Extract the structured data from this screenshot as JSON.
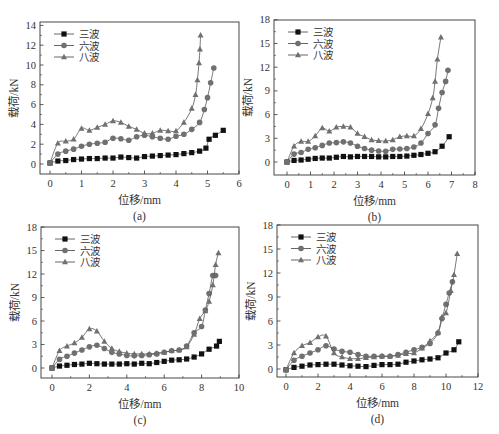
{
  "figure": {
    "legend_labels": [
      "三波",
      "六波",
      "八波"
    ],
    "colors": {
      "frame": "#333333",
      "series_0": "#111111",
      "series_1": "#707070",
      "series_2": "#707070",
      "line": "#555555"
    }
  },
  "chart_data": [
    {
      "type": "line",
      "panel_label": "(a)",
      "xlabel": "位移/mm",
      "ylabel": "载荷/kN",
      "xlim": [
        -0.3,
        6
      ],
      "ylim": [
        -0.9,
        14
      ],
      "xticks": [
        0,
        1,
        2,
        3,
        4,
        5,
        6
      ],
      "yticks": [
        0,
        2,
        4,
        6,
        8,
        10,
        12,
        14
      ],
      "legend_position": "upper-left",
      "grid": false,
      "frame": {
        "left": 40,
        "top": 22,
        "right": 239,
        "bottom": 174,
        "x0px": 50,
        "xscale": 31.5,
        "y0px": 164,
        "yscale": 9.9
      },
      "series": [
        {
          "name": "三波",
          "marker": "square",
          "x": [
            0,
            0.25,
            0.5,
            0.75,
            1.0,
            1.25,
            1.5,
            1.75,
            2.0,
            2.25,
            2.5,
            2.75,
            3.0,
            3.25,
            3.5,
            3.75,
            4.0,
            4.25,
            4.5,
            4.75,
            4.95,
            5.05,
            5.25,
            5.5
          ],
          "y": [
            0.1,
            0.3,
            0.35,
            0.45,
            0.5,
            0.55,
            0.55,
            0.6,
            0.6,
            0.7,
            0.65,
            0.6,
            0.75,
            0.8,
            0.85,
            0.9,
            0.95,
            1.05,
            1.15,
            1.3,
            1.6,
            2.5,
            2.9,
            3.4
          ]
        },
        {
          "name": "六波",
          "marker": "circle",
          "x": [
            0,
            0.25,
            0.5,
            0.75,
            1.0,
            1.25,
            1.5,
            1.75,
            2.0,
            2.25,
            2.5,
            2.75,
            3.0,
            3.25,
            3.5,
            3.75,
            4.0,
            4.25,
            4.5,
            4.75,
            4.9,
            5.0,
            5.1,
            5.2
          ],
          "y": [
            0.1,
            1.0,
            1.3,
            1.5,
            1.8,
            2.0,
            2.1,
            2.2,
            2.6,
            2.55,
            2.4,
            2.75,
            2.9,
            2.75,
            2.6,
            2.5,
            2.8,
            3.0,
            3.5,
            4.2,
            5.5,
            6.7,
            8.2,
            9.7
          ]
        },
        {
          "name": "八波",
          "marker": "triangle",
          "x": [
            0,
            0.25,
            0.5,
            0.75,
            1.0,
            1.25,
            1.5,
            1.75,
            2.0,
            2.25,
            2.5,
            2.75,
            3.0,
            3.25,
            3.5,
            3.75,
            4.0,
            4.25,
            4.5,
            4.62,
            4.68,
            4.73,
            4.76,
            4.78
          ],
          "y": [
            0.1,
            2.1,
            2.3,
            2.5,
            3.6,
            3.4,
            3.7,
            4.0,
            4.35,
            4.2,
            3.8,
            3.5,
            3.1,
            3.1,
            3.4,
            3.35,
            3.35,
            4.2,
            5.6,
            7.0,
            8.5,
            10.2,
            11.6,
            13.0
          ]
        }
      ]
    },
    {
      "type": "line",
      "panel_label": "(b)",
      "xlabel": "位移/mm",
      "ylabel": "载荷/kN",
      "xlim": [
        -0.5,
        8
      ],
      "ylim": [
        -1.5,
        18
      ],
      "xticks": [
        0,
        1,
        2,
        3,
        4,
        5,
        6,
        7,
        8
      ],
      "yticks": [
        0,
        3,
        6,
        9,
        12,
        15,
        18
      ],
      "legend_position": "upper-left",
      "grid": false,
      "frame": {
        "left": 274,
        "top": 20,
        "right": 475,
        "bottom": 175,
        "x0px": 287,
        "xscale": 23.5,
        "y0px": 162,
        "yscale": 7.9
      },
      "series": [
        {
          "name": "三波",
          "marker": "square",
          "x": [
            0,
            0.3,
            0.6,
            0.9,
            1.2,
            1.5,
            1.8,
            2.1,
            2.4,
            2.7,
            3.0,
            3.3,
            3.6,
            3.9,
            4.2,
            4.5,
            4.8,
            5.1,
            5.4,
            5.7,
            6.0,
            6.3,
            6.6,
            6.9
          ],
          "y": [
            0,
            0.2,
            0.25,
            0.35,
            0.45,
            0.5,
            0.5,
            0.6,
            0.7,
            0.65,
            0.7,
            0.7,
            0.7,
            0.65,
            0.65,
            0.7,
            0.7,
            0.75,
            0.85,
            0.95,
            1.1,
            1.3,
            2.0,
            3.2
          ]
        },
        {
          "name": "六波",
          "marker": "circle",
          "x": [
            0,
            0.3,
            0.6,
            0.9,
            1.2,
            1.5,
            1.8,
            2.1,
            2.4,
            2.7,
            3.0,
            3.3,
            3.6,
            3.9,
            4.2,
            4.5,
            4.8,
            5.1,
            5.4,
            5.7,
            6.0,
            6.3,
            6.45,
            6.6,
            6.75,
            6.85
          ],
          "y": [
            0,
            1.0,
            1.2,
            1.6,
            1.8,
            2.1,
            2.4,
            2.45,
            2.55,
            2.4,
            2.0,
            1.7,
            1.5,
            1.4,
            1.35,
            1.6,
            1.65,
            1.7,
            1.9,
            2.4,
            3.6,
            4.7,
            6.8,
            8.8,
            10.2,
            11.6
          ]
        },
        {
          "name": "八波",
          "marker": "triangle",
          "x": [
            0,
            0.3,
            0.6,
            0.9,
            1.2,
            1.5,
            1.8,
            2.1,
            2.4,
            2.7,
            3.0,
            3.3,
            3.6,
            3.9,
            4.2,
            4.5,
            4.8,
            5.1,
            5.4,
            5.7,
            6.0,
            6.2,
            6.3,
            6.4,
            6.55
          ],
          "y": [
            0,
            2.0,
            2.6,
            2.6,
            3.3,
            4.3,
            3.9,
            4.4,
            4.5,
            4.4,
            3.6,
            3.2,
            2.8,
            2.7,
            2.65,
            2.8,
            3.2,
            3.3,
            3.3,
            4.2,
            6.1,
            8.1,
            10.2,
            13.0,
            15.8
          ]
        }
      ]
    },
    {
      "type": "line",
      "panel_label": "(c)",
      "xlabel": "位移/mm",
      "ylabel": "载荷/kN",
      "xlim": [
        -0.6,
        10
      ],
      "ylim": [
        -1.5,
        18
      ],
      "xticks": [
        0,
        2,
        4,
        6,
        8,
        10
      ],
      "yticks": [
        0,
        3,
        6,
        9,
        12,
        15,
        18
      ],
      "legend_position": "upper-left",
      "grid": false,
      "frame": {
        "left": 41,
        "top": 227,
        "right": 239,
        "bottom": 378,
        "x0px": 52,
        "xscale": 18.7,
        "y0px": 368,
        "yscale": 7.83
      },
      "series": [
        {
          "name": "三波",
          "marker": "square",
          "x": [
            0,
            0.4,
            0.8,
            1.2,
            1.6,
            2.0,
            2.4,
            2.8,
            3.2,
            3.6,
            4.0,
            4.4,
            4.8,
            5.2,
            5.6,
            6.0,
            6.4,
            6.8,
            7.2,
            7.6,
            8.0,
            8.4,
            8.8,
            8.95
          ],
          "y": [
            0,
            0.25,
            0.35,
            0.45,
            0.5,
            0.6,
            0.55,
            0.5,
            0.5,
            0.5,
            0.55,
            0.5,
            0.6,
            0.55,
            0.7,
            0.85,
            1.0,
            1.05,
            1.15,
            1.4,
            1.8,
            2.4,
            2.8,
            3.4
          ]
        },
        {
          "name": "六波",
          "marker": "circle",
          "x": [
            0,
            0.4,
            0.8,
            1.2,
            1.6,
            2.0,
            2.4,
            2.8,
            3.2,
            3.6,
            4.0,
            4.4,
            4.8,
            5.2,
            5.6,
            6.0,
            6.4,
            6.8,
            7.2,
            7.6,
            8.0,
            8.2,
            8.4,
            8.6,
            8.75
          ],
          "y": [
            0,
            1.1,
            1.5,
            1.9,
            2.3,
            2.7,
            2.9,
            2.5,
            2.0,
            1.8,
            1.6,
            1.55,
            1.6,
            1.7,
            1.8,
            2.0,
            2.2,
            2.3,
            2.8,
            4.5,
            5.3,
            7.4,
            9.5,
            11.8,
            11.8
          ]
        },
        {
          "name": "八波",
          "marker": "triangle",
          "x": [
            0,
            0.4,
            0.8,
            1.2,
            1.6,
            2.0,
            2.4,
            2.8,
            3.2,
            3.6,
            4.0,
            4.4,
            4.8,
            5.2,
            5.6,
            6.0,
            6.4,
            6.8,
            7.2,
            7.6,
            7.9,
            8.2,
            8.4,
            8.6,
            8.75,
            8.9
          ],
          "y": [
            0,
            2.2,
            2.8,
            3.2,
            3.9,
            5.0,
            4.7,
            3.4,
            2.5,
            2.1,
            1.9,
            1.8,
            1.8,
            1.8,
            1.9,
            2.0,
            2.2,
            2.3,
            2.7,
            4.3,
            6.3,
            7.3,
            8.5,
            10.6,
            13.2,
            14.7
          ]
        }
      ]
    },
    {
      "type": "line",
      "panel_label": "(d)",
      "xlabel": "位移/mm",
      "ylabel": "载荷/kN",
      "xlim": [
        -0.5,
        12
      ],
      "ylim": [
        -1.5,
        18
      ],
      "xticks": [
        0,
        2,
        4,
        6,
        8,
        10,
        12
      ],
      "yticks": [
        0,
        3,
        6,
        9,
        12,
        15,
        18
      ],
      "legend_position": "upper-left",
      "grid": false,
      "frame": {
        "left": 277,
        "top": 225,
        "right": 478,
        "bottom": 377,
        "x0px": 286,
        "xscale": 16.0,
        "y0px": 369,
        "yscale": 8.0
      },
      "series": [
        {
          "name": "三波",
          "marker": "square",
          "x": [
            0,
            0.5,
            1.0,
            1.5,
            2.0,
            2.5,
            3.0,
            3.5,
            4.0,
            4.5,
            5.0,
            5.5,
            6.0,
            6.5,
            7.0,
            7.5,
            8.0,
            8.5,
            9.0,
            9.5,
            10.0,
            10.5,
            10.8
          ],
          "y": [
            -0.1,
            0.2,
            0.35,
            0.5,
            0.55,
            0.6,
            0.6,
            0.5,
            0.4,
            0.35,
            0.3,
            0.45,
            0.55,
            0.55,
            0.6,
            0.85,
            1.0,
            1.15,
            1.25,
            1.4,
            2.0,
            2.4,
            3.4
          ]
        },
        {
          "name": "六波",
          "marker": "circle",
          "x": [
            0,
            0.5,
            1.0,
            1.5,
            2.0,
            2.5,
            3.0,
            3.5,
            4.0,
            4.5,
            5.0,
            5.5,
            6.0,
            6.5,
            7.0,
            7.5,
            8.0,
            8.5,
            9.0,
            9.5,
            9.75,
            10.0,
            10.2,
            10.4
          ],
          "y": [
            -0.1,
            1.1,
            1.6,
            2.0,
            2.4,
            2.9,
            2.5,
            2.2,
            2.1,
            1.8,
            1.6,
            1.6,
            1.6,
            1.6,
            1.8,
            2.1,
            2.4,
            2.7,
            3.2,
            4.5,
            6.3,
            8.1,
            9.5,
            10.9
          ]
        },
        {
          "name": "八波",
          "marker": "triangle",
          "x": [
            0,
            0.5,
            1.0,
            1.5,
            2.0,
            2.5,
            3.0,
            3.5,
            4.0,
            4.5,
            5.0,
            5.5,
            6.0,
            6.5,
            7.0,
            7.5,
            8.0,
            8.5,
            9.0,
            9.5,
            9.75,
            10.0,
            10.3,
            10.5,
            10.7
          ],
          "y": [
            -0.1,
            2.0,
            2.9,
            3.3,
            4.0,
            4.1,
            2.0,
            1.5,
            1.3,
            1.3,
            1.4,
            1.5,
            1.6,
            1.6,
            1.7,
            1.9,
            2.0,
            2.6,
            3.5,
            4.6,
            6.5,
            7.0,
            9.8,
            11.8,
            14.4
          ]
        }
      ]
    }
  ]
}
